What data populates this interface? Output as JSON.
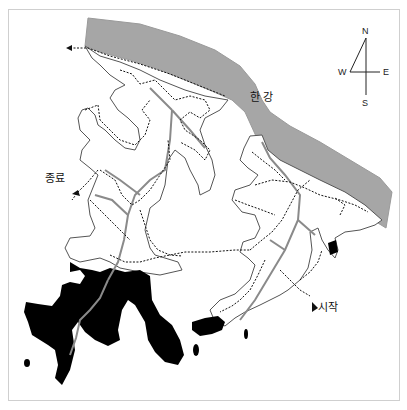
{
  "map": {
    "river_label": "한 강",
    "start_label": "시작",
    "end_label": "종료",
    "compass": {
      "n": "N",
      "s": "S",
      "e": "E",
      "w": "W"
    },
    "colors": {
      "river": "#a6a6a6",
      "land_outline": "#555555",
      "dark_area": "#000000",
      "trail": "#111111",
      "stream": "#8a8a8a",
      "frame": "#cfcfcf"
    }
  }
}
